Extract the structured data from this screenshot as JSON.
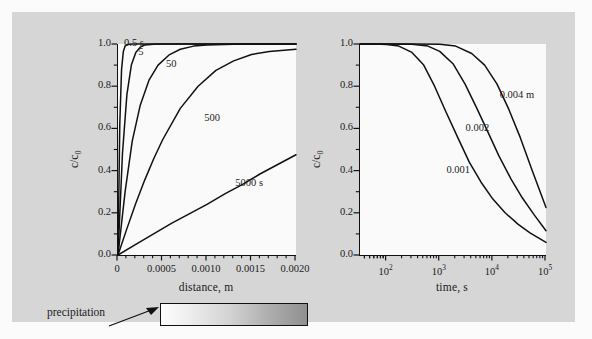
{
  "figure": {
    "background_color": "#d6d6d6",
    "panel_color": "#fafafa",
    "curve_color": "#111111"
  },
  "annotation": {
    "precipitation_label": "precipitation",
    "gradient_from": "#fdfdfd",
    "gradient_to": "#8f8f8f"
  },
  "chart_data": [
    {
      "type": "line",
      "id": "left-panel",
      "title": "",
      "xlabel": "distance, m",
      "ylabel": "c/c0",
      "ylabel_display": "c/c₀",
      "xlim": [
        0,
        0.002
      ],
      "ylim": [
        0,
        1.0
      ],
      "xscale": "linear",
      "yscale": "linear",
      "xticks": [
        0,
        0.0005,
        0.001,
        0.0015,
        0.002
      ],
      "xticklabels": [
        "0",
        "0.0005",
        "0.0010",
        "0.0015",
        "0.0020"
      ],
      "yticks": [
        0.0,
        0.2,
        0.4,
        0.6,
        0.8,
        1.0
      ],
      "yticklabels": [
        "0.0",
        "0.2",
        "0.4",
        "0.6",
        "0.8",
        "1.0"
      ],
      "minor_xticks_per_interval": 5,
      "minor_yticks_per_interval": 2,
      "grid": false,
      "legend": "inline-curve-labels",
      "series": [
        {
          "name": "0.5 s",
          "label": "0.5 s",
          "label_x": 8e-05,
          "label_y": 1.06,
          "x": [
            0,
            2e-05,
            4e-05,
            6e-05,
            8e-05,
            0.0001,
            0.00013,
            0.00016,
            0.0002,
            0.0005,
            0.001,
            0.002
          ],
          "y": [
            0.0,
            0.62,
            0.88,
            0.965,
            0.99,
            0.997,
            0.999,
            1.0,
            1.0,
            1.0,
            1.0,
            1.0
          ]
        },
        {
          "name": "5 s",
          "label": "5",
          "label_x": 0.00024,
          "label_y": 0.955,
          "x": [
            0,
            5e-05,
            0.0001,
            0.00015,
            0.0002,
            0.00025,
            0.0003,
            0.0004,
            0.0005,
            0.001,
            0.002
          ],
          "y": [
            0.0,
            0.48,
            0.76,
            0.9,
            0.96,
            0.985,
            0.995,
            0.999,
            1.0,
            1.0,
            1.0
          ]
        },
        {
          "name": "50 s",
          "label": "50",
          "label_x": 0.00055,
          "label_y": 0.9,
          "x": [
            0,
            8e-05,
            0.00016,
            0.00025,
            0.00035,
            0.00045,
            0.00058,
            0.0007,
            0.00085,
            0.001,
            0.0013,
            0.0016,
            0.002
          ],
          "y": [
            0.0,
            0.3,
            0.54,
            0.71,
            0.83,
            0.9,
            0.95,
            0.975,
            0.99,
            0.995,
            0.999,
            1.0,
            1.0
          ]
        },
        {
          "name": "500 s",
          "label": "500",
          "label_x": 0.00098,
          "label_y": 0.645,
          "x": [
            0,
            0.0001,
            0.0002,
            0.0003,
            0.0004,
            0.0005,
            0.0007,
            0.0009,
            0.0011,
            0.0013,
            0.0015,
            0.0017,
            0.0019,
            0.002
          ],
          "y": [
            0.0,
            0.125,
            0.245,
            0.355,
            0.455,
            0.545,
            0.695,
            0.8,
            0.875,
            0.92,
            0.95,
            0.965,
            0.972,
            0.975
          ]
        },
        {
          "name": "5000 s",
          "label": "5000 s",
          "label_x": 0.00133,
          "label_y": 0.335,
          "x": [
            0,
            0.0002,
            0.0004,
            0.0006,
            0.0008,
            0.001,
            0.0012,
            0.0014,
            0.0016,
            0.0018,
            0.002
          ],
          "y": [
            0.0,
            0.05,
            0.1,
            0.15,
            0.195,
            0.24,
            0.29,
            0.335,
            0.385,
            0.43,
            0.475
          ]
        }
      ]
    },
    {
      "type": "line",
      "id": "right-panel",
      "title": "",
      "xlabel": "time, s",
      "ylabel": "c/c0",
      "ylabel_display": "c/c₀",
      "xlim": [
        31.6,
        100000
      ],
      "ylim": [
        0,
        1.0
      ],
      "xscale": "log",
      "yscale": "linear",
      "xticks": [
        100,
        1000,
        10000,
        100000
      ],
      "xticklabels": [
        "10²",
        "10³",
        "10⁴",
        "10⁵"
      ],
      "yticks": [
        0.0,
        0.2,
        0.4,
        0.6,
        0.8,
        1.0
      ],
      "yticklabels": [
        "0.0",
        "0.2",
        "0.4",
        "0.6",
        "0.8",
        "1.0"
      ],
      "grid": false,
      "legend": "inline-curve-labels",
      "series": [
        {
          "name": "0.001 m",
          "label": "0.001",
          "label_x": 1400,
          "label_y": 0.4,
          "x": [
            31.6,
            60,
            100,
            170,
            300,
            500,
            800,
            1300,
            2200,
            3600,
            6000,
            10000,
            17000,
            30000,
            50000,
            100000
          ],
          "y": [
            1.0,
            1.0,
            0.998,
            0.99,
            0.96,
            0.9,
            0.8,
            0.68,
            0.555,
            0.44,
            0.345,
            0.265,
            0.2,
            0.145,
            0.105,
            0.06
          ]
        },
        {
          "name": "0.002 m",
          "label": "0.002",
          "label_x": 3200,
          "label_y": 0.595,
          "x": [
            31.6,
            100,
            300,
            600,
            1000,
            1800,
            3000,
            5000,
            8000,
            13000,
            22000,
            36000,
            60000,
            100000
          ],
          "y": [
            1.0,
            1.0,
            0.999,
            0.99,
            0.965,
            0.905,
            0.81,
            0.695,
            0.585,
            0.47,
            0.36,
            0.27,
            0.19,
            0.115
          ]
        },
        {
          "name": "0.004 m",
          "label": "0.004 m",
          "label_x": 14000,
          "label_y": 0.755,
          "x": [
            31.6,
            300,
            1000,
            2000,
            4000,
            7000,
            12000,
            20000,
            33000,
            55000,
            100000
          ],
          "y": [
            1.0,
            1.0,
            0.999,
            0.99,
            0.955,
            0.9,
            0.81,
            0.69,
            0.555,
            0.4,
            0.225
          ]
        }
      ]
    }
  ]
}
